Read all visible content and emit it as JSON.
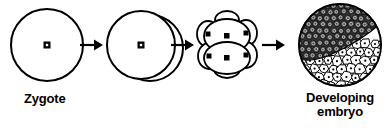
{
  "diagram": {
    "background_color": "#ffffff",
    "line_color": "#000000",
    "labels": {
      "zygote": "Zygote",
      "developing_embryo_line1": "Developing",
      "developing_embryo_line2": "embryo"
    },
    "stages": [
      {
        "id": "zygote",
        "name": "zygote-cell",
        "description": "single round cell with central nucleus",
        "cells": 1
      },
      {
        "id": "two-cell",
        "name": "two-cell-stage",
        "description": "cell dividing into two, second cell offset behind to the right",
        "cells": 2
      },
      {
        "id": "morula",
        "name": "morula-stage",
        "description": "cluster of overlapping cells each with a dark nucleus",
        "cells": 8
      },
      {
        "id": "blastula",
        "name": "developing-embryo-sphere",
        "description": "sphere of many small cells, dark shaded upper-left, light cells lower-right",
        "cells": 120
      }
    ],
    "arrows": [
      {
        "id": "arrow-1",
        "from": "zygote",
        "to": "two-cell"
      },
      {
        "id": "arrow-2",
        "from": "two-cell",
        "to": "morula"
      },
      {
        "id": "arrow-3",
        "from": "morula",
        "to": "blastula"
      }
    ]
  }
}
